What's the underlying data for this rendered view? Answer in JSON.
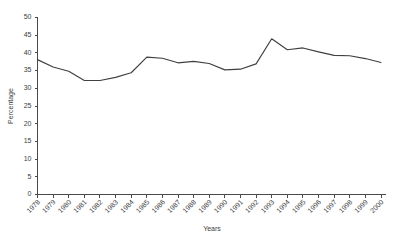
{
  "chart_data": {
    "type": "line",
    "title": "",
    "xlabel": "Years",
    "ylabel": "Percentage",
    "grid": false,
    "legend": "none",
    "ylim": [
      0,
      50
    ],
    "yticks": [
      0,
      5,
      10,
      15,
      20,
      25,
      30,
      35,
      40,
      45,
      50
    ],
    "categories": [
      "1978",
      "1979",
      "1980",
      "1981",
      "1982",
      "1983",
      "1984",
      "1985",
      "1986",
      "1987",
      "1988",
      "1989",
      "1990",
      "1991",
      "1992",
      "1993",
      "1994",
      "1995",
      "1996",
      "1997",
      "1998",
      "1999",
      "2000"
    ],
    "values": [
      38.1,
      36.0,
      34.8,
      32.2,
      32.2,
      33.1,
      34.4,
      38.8,
      38.5,
      37.2,
      37.6,
      37.0,
      35.2,
      35.4,
      36.9,
      44.0,
      40.9,
      41.4,
      40.3,
      39.3,
      39.2,
      38.4,
      37.3
    ],
    "series_name": "Percentage",
    "line_color": "#404040",
    "axis_color": "#4a4a4a"
  },
  "axes": {
    "y_title": "Percentage",
    "x_title": "Years"
  }
}
